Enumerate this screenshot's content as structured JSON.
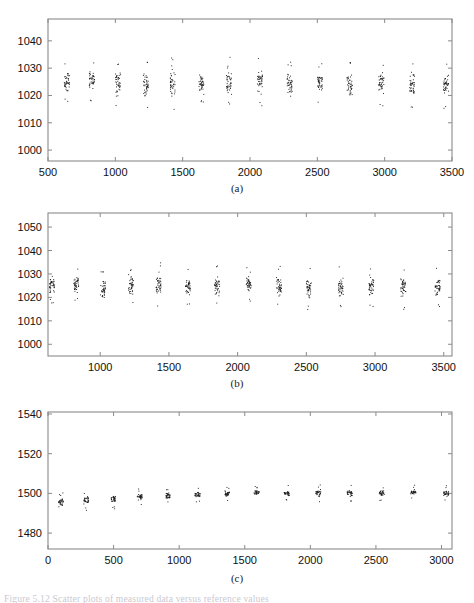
{
  "figure": {
    "panels": [
      {
        "id": "a",
        "caption": "(a)",
        "x_ticks": [
          500,
          1000,
          1500,
          2000,
          2500,
          3000,
          3500
        ],
        "y_ticks": [
          1000,
          1010,
          1020,
          1030,
          1040
        ],
        "xlim": [
          500,
          3500
        ],
        "ylim": [
          996,
          1048
        ],
        "xlabel": "",
        "ylabel": ""
      },
      {
        "id": "b",
        "caption": "(b)",
        "x_ticks": [
          1000,
          1500,
          2000,
          2500,
          3000,
          3500
        ],
        "y_ticks": [
          1000,
          1010,
          1020,
          1030,
          1040,
          1050
        ],
        "xlim": [
          620,
          3560
        ],
        "ylim": [
          995,
          1056
        ],
        "xlabel": "",
        "ylabel": ""
      },
      {
        "id": "c",
        "caption": "(c)",
        "x_ticks": [
          0,
          500,
          1000,
          1500,
          2000,
          2500,
          3000
        ],
        "y_ticks": [
          1480,
          1500,
          1520,
          1540
        ],
        "xlim": [
          0,
          3080
        ],
        "ylim": [
          1472,
          1541
        ],
        "xlabel": "",
        "ylabel": ""
      }
    ],
    "bottom_caption": "Figure 5.12   Scatter plots of measured data versus reference values",
    "axis_color": "#8a8a8a",
    "marker_color": "#1a1a1a"
  },
  "chart_data": [
    {
      "type": "scatter",
      "title": "(a)",
      "xlabel": "",
      "ylabel": "",
      "xlim": [
        500,
        3500
      ],
      "ylim": [
        996,
        1048
      ],
      "grid": false,
      "legend": null,
      "xticks": [
        500,
        1000,
        1500,
        2000,
        2500,
        3000,
        3500
      ],
      "yticks": [
        1000,
        1010,
        1020,
        1030,
        1040
      ],
      "note": "14 vertical clusters of repeated measurements; each cluster centred near 1024 with spread roughly 1017-1033",
      "clusters": [
        {
          "x": 640,
          "mean": 1024.0,
          "min": 1019.5,
          "max": 1030.0,
          "n": 40
        },
        {
          "x": 825,
          "mean": 1025.5,
          "min": 1020.0,
          "max": 1031.5,
          "n": 40
        },
        {
          "x": 1020,
          "mean": 1024.0,
          "min": 1017.0,
          "max": 1030.5,
          "n": 40
        },
        {
          "x": 1225,
          "mean": 1024.5,
          "min": 1016.5,
          "max": 1030.5,
          "n": 40
        },
        {
          "x": 1425,
          "mean": 1024.5,
          "min": 1016.5,
          "max": 1032.0,
          "n": 40
        },
        {
          "x": 1640,
          "mean": 1024.0,
          "min": 1019.0,
          "max": 1030.0,
          "n": 40
        },
        {
          "x": 1845,
          "mean": 1024.5,
          "min": 1018.5,
          "max": 1032.5,
          "n": 40
        },
        {
          "x": 2075,
          "mean": 1024.5,
          "min": 1018.5,
          "max": 1032.5,
          "n": 40
        },
        {
          "x": 2295,
          "mean": 1024.0,
          "min": 1018.0,
          "max": 1030.5,
          "n": 40
        },
        {
          "x": 2520,
          "mean": 1024.0,
          "min": 1019.5,
          "max": 1030.0,
          "n": 40
        },
        {
          "x": 2740,
          "mean": 1024.0,
          "min": 1018.0,
          "max": 1030.5,
          "n": 40
        },
        {
          "x": 2975,
          "mean": 1024.0,
          "min": 1018.5,
          "max": 1030.0,
          "n": 40
        },
        {
          "x": 3205,
          "mean": 1024.0,
          "min": 1017.5,
          "max": 1030.0,
          "n": 40
        },
        {
          "x": 3455,
          "mean": 1024.0,
          "min": 1017.5,
          "max": 1030.0,
          "n": 40
        }
      ]
    },
    {
      "type": "scatter",
      "title": "(b)",
      "xlabel": "",
      "ylabel": "",
      "xlim": [
        620,
        3560
      ],
      "ylim": [
        995,
        1056
      ],
      "grid": false,
      "legend": null,
      "xticks": [
        1000,
        1500,
        2000,
        2500,
        3000,
        3500
      ],
      "yticks": [
        1000,
        1010,
        1020,
        1030,
        1040,
        1050
      ],
      "note": "14 vertical clusters of repeated measurements; each cluster centred near 1025 with spread roughly 1017-1033",
      "clusters": [
        {
          "x": 650,
          "mean": 1025.0,
          "min": 1020.0,
          "max": 1031.0,
          "n": 40
        },
        {
          "x": 825,
          "mean": 1024.5,
          "min": 1021.0,
          "max": 1030.5,
          "n": 40
        },
        {
          "x": 1020,
          "mean": 1024.0,
          "min": 1017.5,
          "max": 1030.0,
          "n": 40
        },
        {
          "x": 1225,
          "mean": 1025.0,
          "min": 1019.5,
          "max": 1031.0,
          "n": 40
        },
        {
          "x": 1425,
          "mean": 1025.5,
          "min": 1017.5,
          "max": 1033.0,
          "n": 40
        },
        {
          "x": 1640,
          "mean": 1024.5,
          "min": 1019.5,
          "max": 1031.0,
          "n": 40
        },
        {
          "x": 1850,
          "mean": 1024.5,
          "min": 1019.0,
          "max": 1031.5,
          "n": 40
        },
        {
          "x": 2080,
          "mean": 1025.0,
          "min": 1020.0,
          "max": 1032.0,
          "n": 40
        },
        {
          "x": 2300,
          "mean": 1024.5,
          "min": 1018.0,
          "max": 1031.5,
          "n": 40
        },
        {
          "x": 2520,
          "mean": 1024.5,
          "min": 1017.0,
          "max": 1030.5,
          "n": 40
        },
        {
          "x": 2750,
          "mean": 1025.0,
          "min": 1017.5,
          "max": 1031.5,
          "n": 40
        },
        {
          "x": 2975,
          "mean": 1025.0,
          "min": 1018.0,
          "max": 1031.5,
          "n": 40
        },
        {
          "x": 3205,
          "mean": 1024.5,
          "min": 1017.0,
          "max": 1031.0,
          "n": 40
        },
        {
          "x": 3455,
          "mean": 1025.0,
          "min": 1018.5,
          "max": 1030.5,
          "n": 40
        }
      ]
    },
    {
      "type": "scatter",
      "title": "(c)",
      "xlabel": "",
      "ylabel": "",
      "xlim": [
        0,
        3080
      ],
      "ylim": [
        1472,
        1541
      ],
      "grid": false,
      "legend": null,
      "xticks": [
        0,
        500,
        1000,
        1500,
        2000,
        2500,
        3000
      ],
      "yticks": [
        1480,
        1500,
        1520,
        1540
      ],
      "note": "14 tight vertical clusters near 1500 with a slight upward drift from ~1495 to ~1501",
      "clusters": [
        {
          "x": 100,
          "mean": 1495.5,
          "min": 1492.0,
          "max": 1498.5,
          "n": 30
        },
        {
          "x": 290,
          "mean": 1497.0,
          "min": 1493.5,
          "max": 1499.5,
          "n": 30
        },
        {
          "x": 500,
          "mean": 1497.5,
          "min": 1494.5,
          "max": 1500.5,
          "n": 30
        },
        {
          "x": 700,
          "mean": 1498.5,
          "min": 1496.0,
          "max": 1500.5,
          "n": 30
        },
        {
          "x": 915,
          "mean": 1499.0,
          "min": 1496.5,
          "max": 1501.0,
          "n": 30
        },
        {
          "x": 1140,
          "mean": 1499.5,
          "min": 1497.5,
          "max": 1501.5,
          "n": 30
        },
        {
          "x": 1365,
          "mean": 1500.0,
          "min": 1497.5,
          "max": 1502.0,
          "n": 30
        },
        {
          "x": 1590,
          "mean": 1500.5,
          "min": 1498.5,
          "max": 1502.0,
          "n": 30
        },
        {
          "x": 1820,
          "mean": 1500.0,
          "min": 1498.0,
          "max": 1502.0,
          "n": 30
        },
        {
          "x": 2060,
          "mean": 1500.5,
          "min": 1497.5,
          "max": 1502.5,
          "n": 30
        },
        {
          "x": 2300,
          "mean": 1500.5,
          "min": 1497.5,
          "max": 1502.5,
          "n": 30
        },
        {
          "x": 2545,
          "mean": 1500.5,
          "min": 1498.5,
          "max": 1502.0,
          "n": 30
        },
        {
          "x": 2785,
          "mean": 1500.5,
          "min": 1498.5,
          "max": 1502.5,
          "n": 30
        },
        {
          "x": 3035,
          "mean": 1500.0,
          "min": 1497.5,
          "max": 1502.5,
          "n": 30
        }
      ]
    }
  ]
}
